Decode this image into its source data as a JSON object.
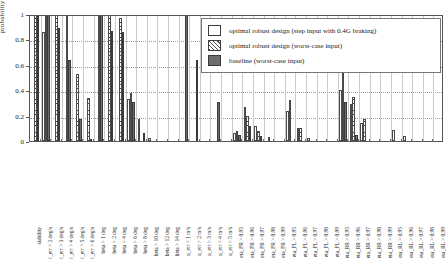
{
  "chart_data": {
    "type": "bar",
    "title": "",
    "xlabel": "",
    "ylabel": "probability",
    "ylim": [
      0,
      1
    ],
    "yticks": [
      "0",
      "0.2",
      "0.4",
      "0.6",
      "0.8",
      "1"
    ],
    "grid": "horizontal-dotted-and-vertical-category-lines",
    "legend_position": "upper-right-inside",
    "categories": [
      "stability",
      "r_err > 2 deg/s",
      "r_err > 3 deg/s",
      "r_err > 4 deg/s",
      "r_err > 5 deg/s",
      "r_err > 6 deg/s",
      "beta > 1 deg",
      "beta > 2 deg",
      "beta > 4 deg",
      "beta > 6 deg",
      "beta > 8 deg",
      "beta > 10 deg",
      "beta > 12 deg",
      "beta > 14 deg",
      "u_err > 1 m/s",
      "u_err > 2 m/s",
      "u_err > 3 m/s",
      "u_err > 4 m/s",
      "u_err > 5 m/s",
      "eta_FR > 0.95",
      "eta_FR > 0.96",
      "eta_FR > 0.97",
      "eta_FR > 0.98",
      "eta_FR > 0.99",
      "eta_FL > 0.95",
      "eta_FL > 0.96",
      "eta_FL > 0.97",
      "eta_FL > 0.98",
      "eta_FL > 0.99",
      "eta_RR > 0.95",
      "eta_RR > 0.96",
      "eta_RR > 0.97",
      "eta_RR > 0.98",
      "eta_RR > 0.99",
      "eta_RL > 0.95",
      "eta_RL > 0.96",
      "eta_RL > 0.97",
      "eta_RL > 0.98",
      "eta_RL > 0.99"
    ],
    "series": [
      {
        "name": "optimal robust design (step input with 0.4G braking)",
        "style": "open",
        "values": [
          0.0,
          0.86,
          0.0,
          0.0,
          0.0,
          0.0,
          0.0,
          0.0,
          0.0,
          0.33,
          0.17,
          0.02,
          0.0,
          0.0,
          0.0,
          0.0,
          0.0,
          0.0,
          0.0,
          0.06,
          0.27,
          0.12,
          0.0,
          0.0,
          0.24,
          0.1,
          0.02,
          0.0,
          0.0,
          0.4,
          0.29,
          0.14,
          0.0,
          0.0,
          0.09,
          0.04,
          0.0,
          0.0,
          0.0
        ]
      },
      {
        "name": "optimal robust design (worst-case input)",
        "style": "hatched",
        "values": [
          1.0,
          1.0,
          1.0,
          1.0,
          0.53,
          0.34,
          1.0,
          1.0,
          0.97,
          0.38,
          0.0,
          0.0,
          0.0,
          0.0,
          0.0,
          0.0,
          0.0,
          0.0,
          0.0,
          0.08,
          0.2,
          0.08,
          0.03,
          0.0,
          0.32,
          0.1,
          0.0,
          0.0,
          0.0,
          0.55,
          0.35,
          0.17,
          0.0,
          0.0,
          0.0,
          0.0,
          0.0,
          0.0,
          0.0
        ]
      },
      {
        "name": "baseline (worst-case input)",
        "style": "solid",
        "values": [
          1.0,
          1.0,
          0.89,
          0.64,
          0.17,
          0.01,
          1.0,
          0.87,
          0.86,
          0.31,
          0.06,
          0.0,
          0.0,
          0.0,
          1.0,
          0.64,
          0.0,
          0.31,
          0.0,
          0.05,
          0.12,
          0.04,
          0.0,
          0.0,
          0.0,
          0.0,
          0.0,
          0.0,
          0.0,
          0.31,
          0.05,
          0.0,
          0.0,
          0.0,
          0.0,
          0.0,
          0.0,
          0.0,
          0.0
        ]
      }
    ]
  },
  "legend": {
    "items": [
      {
        "label": "optimal robust design (step input with 0.4G braking)",
        "style": "s1"
      },
      {
        "label": "optimal robust design (worst-case input)",
        "style": "s2"
      },
      {
        "label": "baseline (worst-case input)",
        "style": "s3"
      }
    ]
  },
  "axes": {
    "ylabel": "probability",
    "yticks": [
      "1",
      "0.8",
      "0.6",
      "0.4",
      "0.2",
      "0"
    ]
  }
}
